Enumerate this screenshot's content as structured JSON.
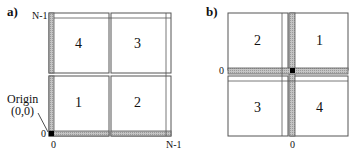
{
  "panel_a": {
    "label": "a)",
    "axis_top_left": "N-1",
    "axis_bottom_left": "0",
    "axis_bottom_zero": "0",
    "axis_bottom_right": "N-1",
    "origin_label": "Origin",
    "origin_coords": "(0,0)",
    "quadrants": {
      "top_left": "4",
      "top_right": "3",
      "bottom_left": "1",
      "bottom_right": "2"
    }
  },
  "panel_b": {
    "label": "b)",
    "axis_left_zero": "0",
    "axis_bottom_zero": "0",
    "quadrants": {
      "top_left": "2",
      "top_right": "1",
      "bottom_left": "3",
      "bottom_right": "4"
    }
  },
  "colors": {
    "strip": "#b8b8b8",
    "origin": "#000000",
    "border": "#555555"
  }
}
